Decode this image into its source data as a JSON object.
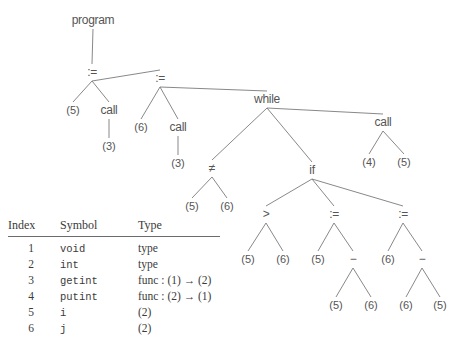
{
  "figure": {
    "kind": "abstract-syntax-tree-with-symbol-table",
    "line_color": "#7a7a7a",
    "text_color": "#555555",
    "background": "#ffffff"
  },
  "tree": {
    "nodes": [
      {
        "id": "program",
        "label": "program",
        "x": 93,
        "y": 20
      },
      {
        "id": "assign-1",
        "label": ":=",
        "x": 92,
        "y": 72
      },
      {
        "id": "leaf-5-a",
        "label": "(5)",
        "x": 73,
        "y": 110
      },
      {
        "id": "call-1",
        "label": "call",
        "x": 109,
        "y": 110
      },
      {
        "id": "leaf-3-a",
        "label": "(3)",
        "x": 109,
        "y": 146
      },
      {
        "id": "assign-2",
        "label": ":=",
        "x": 160,
        "y": 78
      },
      {
        "id": "leaf-6-a",
        "label": "(6)",
        "x": 141,
        "y": 127
      },
      {
        "id": "call-2",
        "label": "call",
        "x": 178,
        "y": 127
      },
      {
        "id": "leaf-3-b",
        "label": "(3)",
        "x": 178,
        "y": 163
      },
      {
        "id": "while",
        "label": "while",
        "x": 267,
        "y": 99
      },
      {
        "id": "neq",
        "label": "≠",
        "x": 212,
        "y": 168
      },
      {
        "id": "leaf-5-b",
        "label": "(5)",
        "x": 192,
        "y": 206
      },
      {
        "id": "leaf-6-b",
        "label": "(6)",
        "x": 227,
        "y": 206
      },
      {
        "id": "if",
        "label": "if",
        "x": 312,
        "y": 170
      },
      {
        "id": "call-3",
        "label": "call",
        "x": 383,
        "y": 122
      },
      {
        "id": "leaf-4-a",
        "label": "(4)",
        "x": 369,
        "y": 162
      },
      {
        "id": "leaf-5-c",
        "label": "(5)",
        "x": 404,
        "y": 162
      },
      {
        "id": "gt",
        "label": ">",
        "x": 266,
        "y": 214
      },
      {
        "id": "leaf-5-d",
        "label": "(5)",
        "x": 248,
        "y": 259
      },
      {
        "id": "leaf-6-c",
        "label": "(6)",
        "x": 283,
        "y": 259
      },
      {
        "id": "assign-3",
        "label": ":=",
        "x": 334,
        "y": 214
      },
      {
        "id": "leaf-5-e",
        "label": "(5)",
        "x": 318,
        "y": 259
      },
      {
        "id": "minus-1",
        "label": "−",
        "x": 353,
        "y": 259
      },
      {
        "id": "leaf-5-f",
        "label": "(5)",
        "x": 336,
        "y": 305
      },
      {
        "id": "leaf-6-d",
        "label": "(6)",
        "x": 371,
        "y": 305
      },
      {
        "id": "assign-4",
        "label": ":=",
        "x": 403,
        "y": 214
      },
      {
        "id": "leaf-6-e",
        "label": "(6)",
        "x": 388,
        "y": 259
      },
      {
        "id": "minus-2",
        "label": "−",
        "x": 422,
        "y": 259
      },
      {
        "id": "leaf-6-f",
        "label": "(6)",
        "x": 406,
        "y": 305
      },
      {
        "id": "leaf-5-g",
        "label": "(5)",
        "x": 440,
        "y": 305
      }
    ],
    "edges": [
      {
        "from": "program",
        "to": "assign-1"
      },
      {
        "from": "assign-1",
        "to": "leaf-5-a"
      },
      {
        "from": "assign-1",
        "to": "call-1"
      },
      {
        "from": "call-1",
        "to": "leaf-3-a"
      },
      {
        "from": "assign-1",
        "to": "assign-2"
      },
      {
        "from": "assign-2",
        "to": "leaf-6-a"
      },
      {
        "from": "assign-2",
        "to": "call-2"
      },
      {
        "from": "call-2",
        "to": "leaf-3-b"
      },
      {
        "from": "assign-2",
        "to": "while"
      },
      {
        "from": "while",
        "to": "neq"
      },
      {
        "from": "neq",
        "to": "leaf-5-b"
      },
      {
        "from": "neq",
        "to": "leaf-6-b"
      },
      {
        "from": "while",
        "to": "if"
      },
      {
        "from": "while",
        "to": "call-3"
      },
      {
        "from": "call-3",
        "to": "leaf-4-a"
      },
      {
        "from": "call-3",
        "to": "leaf-5-c"
      },
      {
        "from": "if",
        "to": "gt"
      },
      {
        "from": "gt",
        "to": "leaf-5-d"
      },
      {
        "from": "gt",
        "to": "leaf-6-c"
      },
      {
        "from": "if",
        "to": "assign-3"
      },
      {
        "from": "assign-3",
        "to": "leaf-5-e"
      },
      {
        "from": "assign-3",
        "to": "minus-1"
      },
      {
        "from": "minus-1",
        "to": "leaf-5-f"
      },
      {
        "from": "minus-1",
        "to": "leaf-6-d"
      },
      {
        "from": "if",
        "to": "assign-4"
      },
      {
        "from": "assign-4",
        "to": "leaf-6-e"
      },
      {
        "from": "assign-4",
        "to": "minus-2"
      },
      {
        "from": "minus-2",
        "to": "leaf-6-f"
      },
      {
        "from": "minus-2",
        "to": "leaf-5-g"
      }
    ]
  },
  "symbol_table": {
    "columns": [
      "Index",
      "Symbol",
      "Type"
    ],
    "rows": [
      {
        "index": "1",
        "symbol": "void",
        "type": "type"
      },
      {
        "index": "2",
        "symbol": "int",
        "type": "type"
      },
      {
        "index": "3",
        "symbol": "getint",
        "type": "func : (1) → (2)"
      },
      {
        "index": "4",
        "symbol": "putint",
        "type": "func : (2) → (1)"
      },
      {
        "index": "5",
        "symbol": "i",
        "type": "(2)"
      },
      {
        "index": "6",
        "symbol": "j",
        "type": "(2)"
      }
    ]
  }
}
